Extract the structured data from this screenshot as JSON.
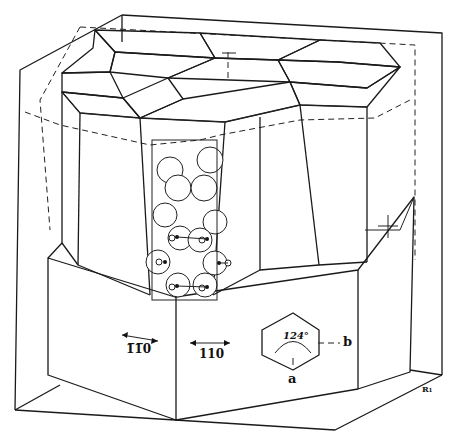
{
  "diagram": {
    "type": "crystal-structure-illustration",
    "labels": {
      "face_left": "1̅1̅0",
      "face_right": "110",
      "angle": "124°",
      "axis_a": "a",
      "axis_b": "b",
      "corner_mark": "R₁"
    },
    "face_left_display": "1̄ 1 0",
    "face_left_text": "1̄1 0"
  }
}
